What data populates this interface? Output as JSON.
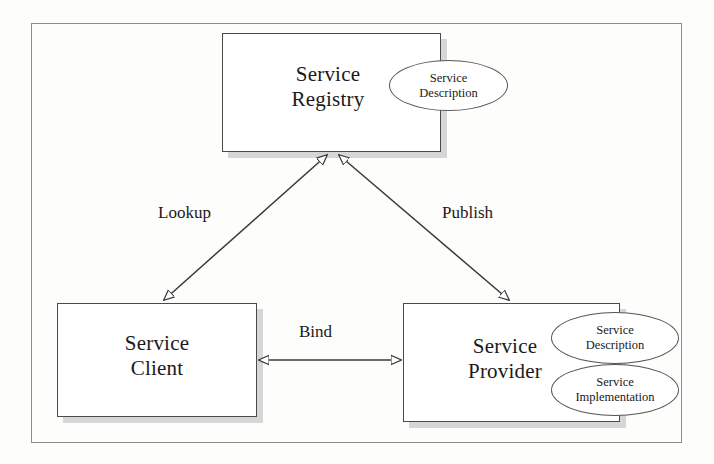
{
  "diagram": {
    "type": "service-oriented-architecture-triangle",
    "nodes": [
      {
        "id": "service-registry",
        "label": "Service\nRegistry",
        "artifacts": [
          {
            "id": "registry-service-description",
            "label": "Service\nDescription"
          }
        ]
      },
      {
        "id": "service-client",
        "label": "Service\nClient",
        "artifacts": []
      },
      {
        "id": "service-provider",
        "label": "Service\nProvider",
        "artifacts": [
          {
            "id": "provider-service-description",
            "label": "Service\nDescription"
          },
          {
            "id": "provider-service-implementation",
            "label": "Service\nImplementation"
          }
        ]
      }
    ],
    "edges": [
      {
        "id": "lookup-edge",
        "label": "Lookup",
        "from": "service-client",
        "to": "service-registry"
      },
      {
        "id": "publish-edge",
        "label": "Publish",
        "from": "service-provider",
        "to": "service-registry"
      },
      {
        "id": "bind-edge",
        "label": "Bind",
        "from": "service-client",
        "to": "service-provider"
      }
    ],
    "colors": {
      "box_border": "#4a4a4a",
      "box_fill": "#ffffff",
      "box_shadow": "#d6d6d6",
      "frame_border": "#8d8d8d",
      "connector": "#3a3a3a",
      "text": "#1a1a1a",
      "background": "#fdfdfc"
    }
  }
}
